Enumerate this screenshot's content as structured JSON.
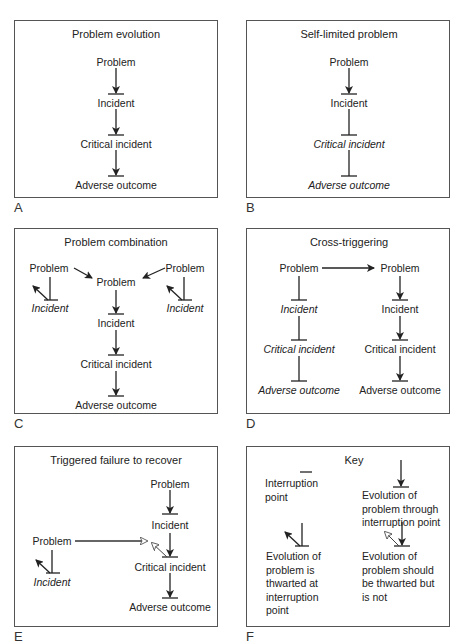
{
  "panels": {
    "A": {
      "letter": "A",
      "title": "Problem evolution",
      "nodes": [
        "Problem",
        "Incident",
        "Critical incident",
        "Adverse outcome"
      ]
    },
    "B": {
      "letter": "B",
      "title": "Self-limited problem",
      "nodes": [
        "Problem",
        "Incident",
        "Critical incident",
        "Adverse outcome"
      ]
    },
    "C": {
      "letter": "C",
      "title": "Problem combination",
      "left_problem": "Problem",
      "left_incident": "Incident",
      "right_problem": "Problem",
      "right_incident": "Incident",
      "nodes": [
        "Problem",
        "Incident",
        "Critical incident",
        "Adverse outcome"
      ]
    },
    "D": {
      "letter": "D",
      "title": "Cross-triggering",
      "left": [
        "Problem",
        "Incident",
        "Critical incident",
        "Adverse outcome"
      ],
      "right": [
        "Problem",
        "Incident",
        "Critical incident",
        "Adverse outcome"
      ]
    },
    "E": {
      "letter": "E",
      "title": "Triggered failure to recover",
      "left_problem": "Problem",
      "left_incident": "Incident",
      "nodes": [
        "Problem",
        "Incident",
        "Critical incident",
        "Adverse outcome"
      ]
    },
    "F": {
      "letter": "F",
      "title": "Key",
      "interruption": [
        "Interruption",
        "point"
      ],
      "through": [
        "Evolution of",
        "problem through",
        "interruption point"
      ],
      "thwarted": [
        "Evolution of",
        "problem is",
        "thwarted at",
        "interruption",
        "point"
      ],
      "not_thwarted": [
        "Evolution of",
        "problem should",
        "be thwarted but",
        "is not"
      ]
    }
  }
}
